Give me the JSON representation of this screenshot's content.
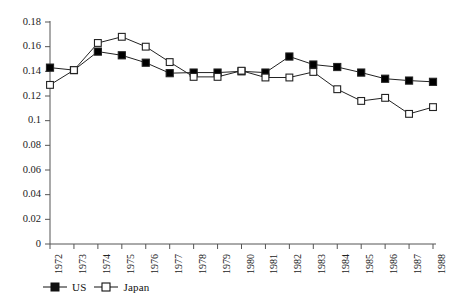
{
  "chart_data": {
    "type": "line",
    "title": "",
    "subtitle": "",
    "xlabel": "",
    "ylabel": "",
    "grid": false,
    "legend_position": "bottom-left",
    "categories": [
      "1972",
      "1973",
      "1974",
      "1975",
      "1976",
      "1977",
      "1978",
      "1979",
      "1980",
      "1981",
      "1982",
      "1983",
      "1984",
      "1985",
      "1986",
      "1987",
      "1988"
    ],
    "x": [
      1972,
      1973,
      1974,
      1975,
      1976,
      1977,
      1978,
      1979,
      1980,
      1981,
      1982,
      1983,
      1984,
      1985,
      1986,
      1987,
      1988
    ],
    "xlim": [
      1972,
      1988
    ],
    "ylim": [
      0,
      0.18
    ],
    "ytick_labels": [
      "0",
      "0.02",
      "0.04",
      "0.06",
      "0.08",
      "0.1",
      "0.12",
      "0.14",
      "0.16",
      "0.18"
    ],
    "ytick_values": [
      0,
      0.02,
      0.04,
      0.06,
      0.08,
      0.1,
      0.12,
      0.14,
      0.16,
      0.18
    ],
    "xtick_labels": [
      "1972",
      "1973",
      "1974",
      "1975",
      "1976",
      "1977",
      "1978",
      "1979",
      "1980",
      "1981",
      "1982",
      "1983",
      "1984",
      "1985",
      "1986",
      "1987",
      "1988"
    ],
    "series": [
      {
        "name": "US",
        "marker": "filled-square",
        "color": "#000000",
        "values": [
          0.143,
          0.141,
          0.156,
          0.153,
          0.147,
          0.1385,
          0.139,
          0.139,
          0.14,
          0.139,
          0.152,
          0.1455,
          0.1435,
          0.139,
          0.134,
          0.1325,
          0.1315
        ]
      },
      {
        "name": "Japan",
        "marker": "open-square",
        "color": "#000000",
        "values": [
          0.129,
          0.141,
          0.163,
          0.168,
          0.16,
          0.1475,
          0.1355,
          0.1355,
          0.1405,
          0.135,
          0.135,
          0.1395,
          0.1255,
          0.116,
          0.1185,
          0.1055,
          0.111
        ]
      }
    ]
  },
  "legend": {
    "items": [
      {
        "label": "US",
        "marker": "filled-square"
      },
      {
        "label": "Japan",
        "marker": "open-square"
      }
    ]
  },
  "axes": {
    "axis_color": "#555555",
    "line_color": "#222222"
  }
}
